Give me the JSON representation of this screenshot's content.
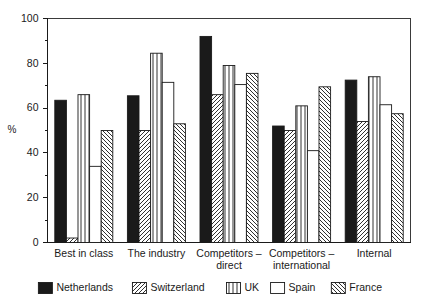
{
  "chart_data": {
    "type": "bar",
    "title": "",
    "subtitle": "",
    "xlabel": "",
    "ylabel": "%",
    "ylim": [
      0,
      100
    ],
    "yticks": [
      0,
      20,
      40,
      60,
      80,
      100
    ],
    "yminorticks": [
      10,
      30,
      50,
      70,
      90
    ],
    "ytick_labels": [
      "0",
      "20",
      "40",
      "60",
      "80",
      "100"
    ],
    "grid": false,
    "legend_position": "bottom",
    "orientation": "vertical",
    "grouping": "grouped",
    "categories": [
      "Best in class",
      "The industry",
      "Competitors – direct",
      "Competitors – international",
      "Internal"
    ],
    "category_lines": [
      [
        "Best in class"
      ],
      [
        "The industry"
      ],
      [
        "Competitors –",
        "direct"
      ],
      [
        "Competitors –",
        "international"
      ],
      [
        "Internal"
      ]
    ],
    "series": [
      {
        "name": "Netherlands",
        "fill": "solid-black",
        "color": "#1a1a1a",
        "values": [
          63.5,
          65.5,
          92.0,
          52.0,
          72.5
        ]
      },
      {
        "name": "Switzerland",
        "fill": "diagonal-forward-hatch",
        "color": "#ffffff",
        "values": [
          2.0,
          50.0,
          66.0,
          50.0,
          54.0
        ]
      },
      {
        "name": "UK",
        "fill": "vertical-lines",
        "color": "#ffffff",
        "values": [
          66.0,
          84.5,
          79.0,
          61.0,
          74.0
        ]
      },
      {
        "name": "Spain",
        "fill": "empty-white",
        "color": "#ffffff",
        "values": [
          34.0,
          71.5,
          70.5,
          41.0,
          61.5
        ]
      },
      {
        "name": "France",
        "fill": "diagonal-back-hatch",
        "color": "#ffffff",
        "values": [
          50.0,
          53.0,
          75.5,
          69.5,
          57.5
        ]
      }
    ]
  },
  "legend": {
    "entries": [
      {
        "label": "Netherlands",
        "fill": "solid-black"
      },
      {
        "label": "Switzerland",
        "fill": "diagonal-forward-hatch"
      },
      {
        "label": "UK",
        "fill": "vertical-lines"
      },
      {
        "label": "Spain",
        "fill": "empty-white"
      },
      {
        "label": "France",
        "fill": "diagonal-back-hatch"
      }
    ]
  },
  "colors": {
    "axis": "#1a1a1a",
    "frame": "#3a3a3a",
    "background": "#ffffff",
    "solid": "#1a1a1a"
  }
}
